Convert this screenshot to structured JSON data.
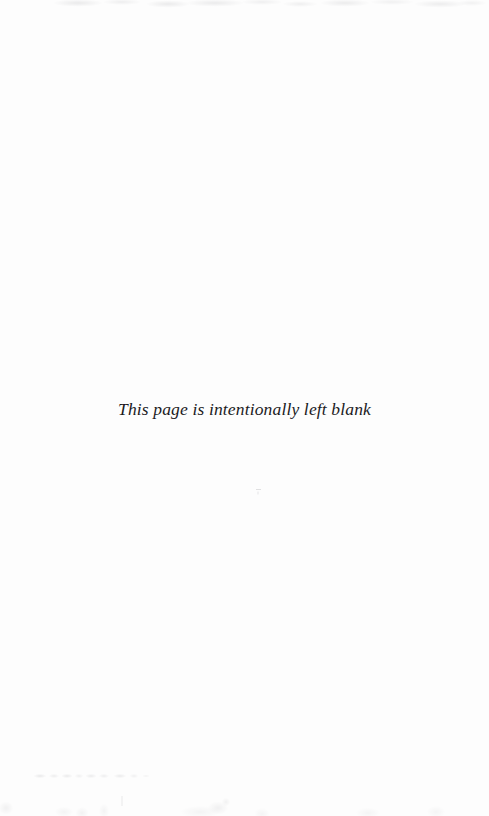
{
  "page": {
    "width": 489,
    "height": 816,
    "background_color": "#fdfdfd",
    "kind": "scanned-book-page"
  },
  "notice": {
    "text": "This page is intentionally left blank",
    "text_color": "#1b1b1d",
    "style": "italic-serif",
    "alignment": "center"
  },
  "artifacts": {
    "top_bleed_label": "faint bleed-through smudges along top edge",
    "speck_label": "small dust speck",
    "ghost_line_label": "illegible faint ghost text",
    "bottom_noise_label": "faint scan noise along bottom edge"
  }
}
